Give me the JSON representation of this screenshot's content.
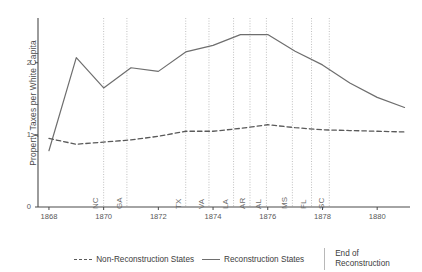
{
  "chart_data": {
    "type": "line",
    "title": "",
    "xlabel": "",
    "ylabel": "Property Taxes per White Capita",
    "xlim": [
      1867.6,
      1881.2
    ],
    "ylim": [
      0,
      2.62
    ],
    "grid": false,
    "legend_position": "bottom",
    "x_ticks": [
      "1868",
      "1870",
      "1872",
      "1874",
      "1876",
      "1878",
      "1880"
    ],
    "x_tick_values": [
      1868,
      1870,
      1872,
      1874,
      1876,
      1878,
      1880
    ],
    "y_ticks": [
      "0",
      "1",
      "2"
    ],
    "y_tick_values": [
      0,
      1,
      2
    ],
    "series": [
      {
        "name": "Reconstruction States",
        "style": "solid",
        "color": "#6e6e6e",
        "x": [
          1868,
          1869,
          1870,
          1871,
          1872,
          1873,
          1874,
          1875,
          1876,
          1877,
          1878,
          1879,
          1880,
          1881
        ],
        "values": [
          0.78,
          2.07,
          1.65,
          1.93,
          1.88,
          2.15,
          2.24,
          2.39,
          2.39,
          2.16,
          1.97,
          1.72,
          1.52,
          1.38
        ]
      },
      {
        "name": "Non-Reconstruction States",
        "style": "dashed",
        "color": "#5a5a5a",
        "x": [
          1868,
          1869,
          1870,
          1871,
          1872,
          1873,
          1874,
          1875,
          1876,
          1877,
          1878,
          1879,
          1880,
          1881
        ],
        "values": [
          0.95,
          0.87,
          0.9,
          0.93,
          0.98,
          1.05,
          1.05,
          1.09,
          1.14,
          1.1,
          1.07,
          1.06,
          1.05,
          1.04
        ]
      }
    ],
    "annotations": [
      {
        "label": "NC",
        "x": 1870.0
      },
      {
        "label": "GA",
        "x": 1870.85
      },
      {
        "label": "TX",
        "x": 1873.0
      },
      {
        "label": "VA",
        "x": 1873.85
      },
      {
        "label": "LA",
        "x": 1874.75
      },
      {
        "label": "AR",
        "x": 1875.35
      },
      {
        "label": "AL",
        "x": 1875.95
      },
      {
        "label": "MS",
        "x": 1876.9
      },
      {
        "label": "FL",
        "x": 1877.6
      },
      {
        "label": "SC",
        "x": 1878.25
      }
    ]
  },
  "legend": {
    "items": [
      {
        "label": "Non-Reconstruction States",
        "style": "dashed"
      },
      {
        "label": "Reconstruction States",
        "style": "solid"
      }
    ],
    "note_line_1": "End of",
    "note_line_2": "Reconstruction"
  },
  "colors": {
    "reconstruction_line": "#6e6e6e",
    "non_reconstruction_line": "#5a5a5a",
    "annotation_line": "#b0b0b0",
    "axis": "#4a4a4a",
    "text": "#4a4a4a"
  }
}
